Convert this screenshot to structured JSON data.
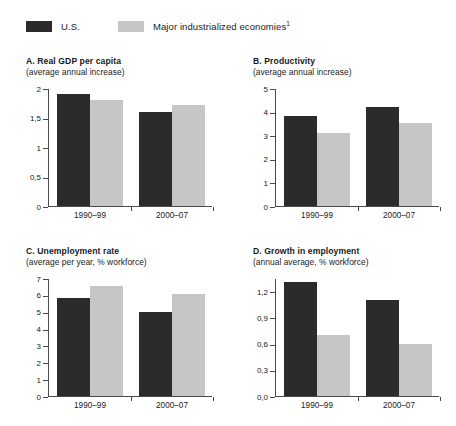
{
  "legend": {
    "series": [
      {
        "label": "U.S.",
        "color": "#2b2b2b",
        "swatch": "dark"
      },
      {
        "label": "Major industrialized economies",
        "footnote": "1",
        "color": "#c6c6c6",
        "swatch": "light"
      }
    ]
  },
  "chart_data": [
    {
      "id": "A",
      "type": "bar",
      "title": "A. Real GDP per capita",
      "subtitle": "(average annual increase)",
      "xlabel": "",
      "ylabel": "",
      "categories": [
        "1990–99",
        "2000–07"
      ],
      "ylim": [
        0,
        2
      ],
      "yticks": [
        0,
        0.5,
        1,
        1.5,
        2
      ],
      "yticklabels": [
        "0",
        "0,5",
        "1",
        "1,5",
        "2"
      ],
      "grid": false,
      "legend_position": "top",
      "series": [
        {
          "name": "U.S.",
          "values": [
            1.9,
            1.6
          ]
        },
        {
          "name": "Major industrialized economies",
          "values": [
            1.8,
            1.71
          ]
        }
      ]
    },
    {
      "id": "B",
      "type": "bar",
      "title": "B. Productivity",
      "subtitle": "(average annual increase)",
      "xlabel": "",
      "ylabel": "",
      "categories": [
        "1990–99",
        "2000–07"
      ],
      "ylim": [
        0,
        5
      ],
      "yticks": [
        0,
        1,
        2,
        3,
        4,
        5
      ],
      "yticklabels": [
        "0",
        "1",
        "2",
        "3",
        "4",
        "5"
      ],
      "grid": false,
      "legend_position": "top",
      "series": [
        {
          "name": "U.S.",
          "values": [
            3.8,
            4.2
          ]
        },
        {
          "name": "Major industrialized economies",
          "values": [
            3.1,
            3.5
          ]
        }
      ]
    },
    {
      "id": "C",
      "type": "bar",
      "title": "C. Unemployment rate",
      "subtitle": "(average per year, % workforce)",
      "xlabel": "",
      "ylabel": "",
      "categories": [
        "1990–99",
        "2000–07"
      ],
      "ylim": [
        0,
        7
      ],
      "yticks": [
        0,
        1,
        2,
        3,
        4,
        5,
        6,
        7
      ],
      "yticklabels": [
        "0",
        "1",
        "2",
        "3",
        "4",
        "5",
        "6",
        "7"
      ],
      "grid": false,
      "legend_position": "top",
      "series": [
        {
          "name": "U.S.",
          "values": [
            5.8,
            5.0
          ]
        },
        {
          "name": "Major industrialized economies",
          "values": [
            6.5,
            6.05
          ]
        }
      ]
    },
    {
      "id": "D",
      "type": "bar",
      "title": "D. Growth in employment",
      "subtitle": "(annual average, % workforce)",
      "xlabel": "",
      "ylabel": "",
      "categories": [
        "1990–99",
        "2000–07"
      ],
      "ylim": [
        0,
        1.35
      ],
      "yticks": [
        0,
        0.3,
        0.6,
        0.9,
        1.2
      ],
      "yticklabels": [
        "0,0",
        "0,3",
        "0,6",
        "0,9",
        "1,2"
      ],
      "grid": false,
      "legend_position": "top",
      "series": [
        {
          "name": "U.S.",
          "values": [
            1.3,
            1.1
          ]
        },
        {
          "name": "Major industrialized economies",
          "values": [
            0.7,
            0.6
          ]
        }
      ]
    }
  ]
}
